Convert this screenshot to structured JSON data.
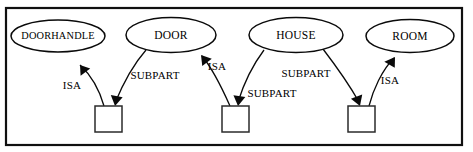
{
  "diagram": {
    "type": "semantic-network",
    "title": "",
    "frame": {
      "visible": true,
      "color": "#101010"
    },
    "nodes": [
      {
        "id": "doorhandle",
        "shape": "ellipse",
        "label": "DOORHANDLE",
        "cx": 58,
        "cy": 36,
        "rx": 47,
        "ry": 16
      },
      {
        "id": "door",
        "shape": "ellipse",
        "label": "DOOR",
        "cx": 171,
        "cy": 35,
        "rx": 45,
        "ry": 17.5
      },
      {
        "id": "house",
        "shape": "ellipse",
        "label": "HOUSE",
        "cx": 296,
        "cy": 35,
        "rx": 47,
        "ry": 17.5
      },
      {
        "id": "room",
        "shape": "ellipse",
        "label": "ROOM",
        "cx": 410,
        "cy": 36,
        "rx": 44,
        "ry": 16.5
      },
      {
        "id": "instance1",
        "shape": "box",
        "label": "",
        "x": 95,
        "y": 106,
        "w": 27,
        "h": 26
      },
      {
        "id": "instance2",
        "shape": "box",
        "label": "",
        "x": 222,
        "y": 106,
        "w": 27,
        "h": 26
      },
      {
        "id": "instance3",
        "shape": "box",
        "label": "",
        "x": 348,
        "y": 106,
        "w": 27,
        "h": 26
      }
    ],
    "edges": [
      {
        "id": "e1",
        "from": "instance1",
        "to": "doorhandle",
        "label": "ISA",
        "label_x": 72,
        "label_y": 86
      },
      {
        "id": "e2",
        "from": "door",
        "to": "instance1",
        "label": "SUBPART",
        "label_x": 155,
        "label_y": 76
      },
      {
        "id": "e3",
        "from": "instance2",
        "to": "door",
        "label": "ISA",
        "label_x": 217,
        "label_y": 67
      },
      {
        "id": "e4",
        "from": "house",
        "to": "instance2",
        "label": "SUBPART",
        "label_x": 272,
        "label_y": 94
      },
      {
        "id": "e5",
        "from": "house",
        "to": "instance3",
        "label": "SUBPART",
        "label_x": 306,
        "label_y": 74
      },
      {
        "id": "e6",
        "from": "instance3",
        "to": "room",
        "label": "ISA",
        "label_x": 390,
        "label_y": 81
      }
    ]
  }
}
